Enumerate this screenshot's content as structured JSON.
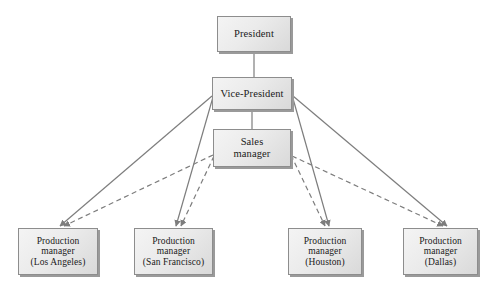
{
  "diagram": {
    "type": "organizational-chart",
    "style": {
      "box_fill": "#ebebeb",
      "box_border": "#8d8d8d",
      "box_shadow": "#9a9a9a",
      "solid_line_color": "#7d7d7d",
      "dashed_line_color": "#7d7d7d",
      "text_color": "#1a1a1a",
      "background": "#ffffff"
    },
    "nodes": [
      {
        "id": "president",
        "label": "President",
        "lines": [
          "President"
        ],
        "x": 217,
        "y": 16,
        "w": 74,
        "h": 36,
        "font_size": 10.5
      },
      {
        "id": "vice-president",
        "label": "Vice-President",
        "lines": [
          "Vice-President"
        ],
        "x": 212,
        "y": 77,
        "w": 80,
        "h": 33,
        "font_size": 10.5
      },
      {
        "id": "sales-manager",
        "label": "Sales manager",
        "lines": [
          "Sales",
          "manager"
        ],
        "x": 213,
        "y": 129,
        "w": 78,
        "h": 38,
        "font_size": 10.5
      },
      {
        "id": "production-manager-los-angeles",
        "label": "Production manager (Los Angeles)",
        "lines": [
          "Production",
          "manager",
          "(Los Angeles)"
        ],
        "x": 18,
        "y": 228,
        "w": 80,
        "h": 47,
        "font_size": 9.5
      },
      {
        "id": "production-manager-san-francisco",
        "label": "Production manager (San Francisco)",
        "lines": [
          "Production",
          "manager",
          "(San Francisco)"
        ],
        "x": 134,
        "y": 228,
        "w": 79,
        "h": 47,
        "font_size": 9.5
      },
      {
        "id": "production-manager-houston",
        "label": "Production manager (Houston)",
        "lines": [
          "Production",
          "manager",
          "(Houston)"
        ],
        "x": 288,
        "y": 228,
        "w": 74,
        "h": 47,
        "font_size": 9.5
      },
      {
        "id": "production-manager-dallas",
        "label": "Production manager (Dallas)",
        "lines": [
          "Production",
          "manager",
          "(Dallas)"
        ],
        "x": 403,
        "y": 228,
        "w": 75,
        "h": 47,
        "font_size": 9.5
      }
    ],
    "edges": [
      {
        "id": "president-to-vice-president",
        "kind": "solid",
        "from": "president",
        "to": "vice-president",
        "arrow": false,
        "x1": 254,
        "y1": 52,
        "x2": 254,
        "y2": 77
      },
      {
        "id": "vice-president-to-sales-manager",
        "kind": "solid",
        "from": "vice-president",
        "to": "sales-manager",
        "arrow": false,
        "x1": 252,
        "y1": 110,
        "x2": 252,
        "y2": 129
      },
      {
        "id": "vice-president-to-los-angeles",
        "kind": "solid",
        "from": "vice-president",
        "to": "production-manager-los-angeles",
        "arrow": true,
        "x1": 212,
        "y1": 96,
        "x2": 60,
        "y2": 226
      },
      {
        "id": "vice-president-to-san-francisco",
        "kind": "solid",
        "from": "vice-president",
        "to": "production-manager-san-francisco",
        "arrow": true,
        "x1": 213,
        "y1": 97,
        "x2": 176,
        "y2": 226
      },
      {
        "id": "vice-president-to-houston",
        "kind": "solid",
        "from": "vice-president",
        "to": "production-manager-houston",
        "arrow": true,
        "x1": 292,
        "y1": 95,
        "x2": 329,
        "y2": 226
      },
      {
        "id": "vice-president-to-dallas",
        "kind": "solid",
        "from": "vice-president",
        "to": "production-manager-dallas",
        "arrow": true,
        "x1": 293,
        "y1": 96,
        "x2": 447,
        "y2": 226
      },
      {
        "id": "sales-manager-to-los-angeles",
        "kind": "dashed",
        "from": "sales-manager",
        "to": "production-manager-los-angeles",
        "arrow": true,
        "x1": 213,
        "y1": 155,
        "x2": 64,
        "y2": 226
      },
      {
        "id": "sales-manager-to-san-francisco",
        "kind": "dashed",
        "from": "sales-manager",
        "to": "production-manager-san-francisco",
        "arrow": true,
        "x1": 214,
        "y1": 156,
        "x2": 181,
        "y2": 226
      },
      {
        "id": "sales-manager-to-houston",
        "kind": "dashed",
        "from": "sales-manager",
        "to": "production-manager-houston",
        "arrow": true,
        "x1": 291,
        "y1": 155,
        "x2": 325,
        "y2": 226
      },
      {
        "id": "sales-manager-to-dallas",
        "kind": "dashed",
        "from": "sales-manager",
        "to": "production-manager-dallas",
        "arrow": true,
        "x1": 292,
        "y1": 156,
        "x2": 443,
        "y2": 226
      }
    ]
  }
}
